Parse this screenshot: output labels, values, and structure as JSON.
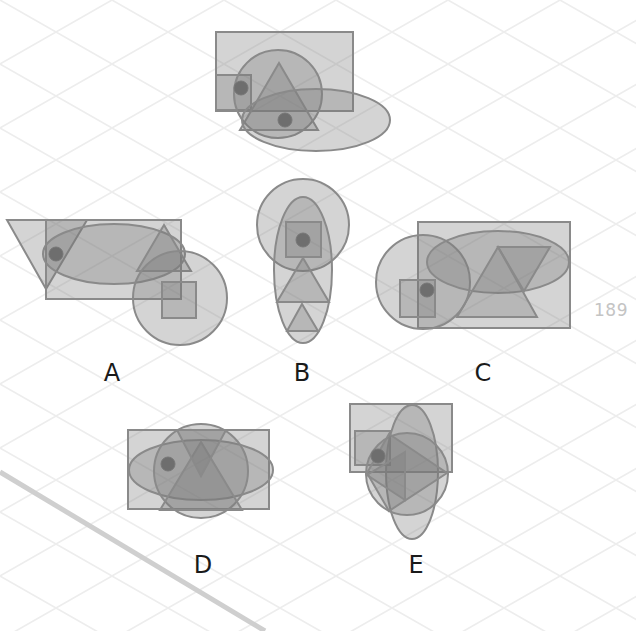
{
  "page": {
    "page_number": "189",
    "background_color": "#ffffff",
    "grid_color": "#eeeeee",
    "shape_fill": "rgba(120,120,120,0.32)",
    "shape_stroke": "#8a8a8a",
    "dot_color": "#6e6e6e"
  },
  "question": {
    "name": "question-figure",
    "shapes": [
      "rectangle",
      "square",
      "circle",
      "triangle",
      "ellipse",
      "dot",
      "dot"
    ]
  },
  "options": [
    {
      "label": "A",
      "shapes": [
        "trapezoid",
        "rectangle",
        "ellipse",
        "triangle",
        "circle",
        "square",
        "dot"
      ]
    },
    {
      "label": "B",
      "shapes": [
        "circle",
        "ellipse",
        "square",
        "triangle",
        "triangle",
        "dot"
      ]
    },
    {
      "label": "C",
      "shapes": [
        "rectangle",
        "circle",
        "ellipse",
        "triangle",
        "inverted-triangle",
        "square",
        "dot"
      ]
    },
    {
      "label": "D",
      "shapes": [
        "rectangle",
        "ellipse",
        "circle",
        "triangle",
        "inverted-triangle",
        "dot"
      ]
    },
    {
      "label": "E",
      "shapes": [
        "rectangle",
        "square",
        "ellipse",
        "circle",
        "diamond",
        "triangle",
        "dot"
      ]
    }
  ]
}
